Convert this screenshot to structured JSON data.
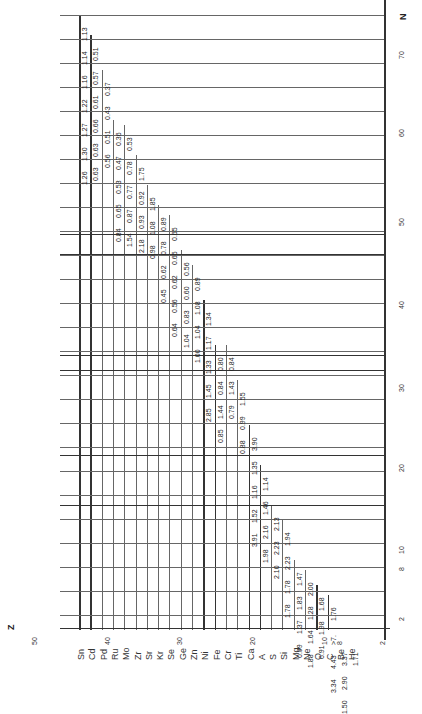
{
  "axes": {
    "z_label": "Z",
    "n_label": "N",
    "z_ticks": [
      "50",
      "40",
      "30",
      "20",
      "10",
      "8",
      "2"
    ],
    "n_ticks": [
      "70",
      "60",
      "50",
      "40",
      "30",
      "20",
      "10",
      "8",
      "2"
    ]
  },
  "elements": [
    "Sn",
    "Cd",
    "Pd",
    "Ru",
    "Mo",
    "Zr",
    "Sr",
    "Kr",
    "Se",
    "Ge",
    "Zn",
    "Ni",
    "Fe",
    "Cr",
    "Ti",
    "Ca",
    "A",
    "S",
    "Si",
    "Mg",
    "Ne",
    "O",
    "C",
    "Be",
    "He"
  ],
  "rows": [
    {
      "element": "Sn",
      "values": [
        "1.26",
        "1.30",
        "1.27",
        "1.22",
        "1.16",
        "1.14",
        "1.13"
      ]
    },
    {
      "element": "Cd",
      "values": [
        "0.63",
        "0.63",
        "0.66",
        "0.61",
        "0.57",
        "0.51"
      ]
    },
    {
      "element": "Pd",
      "values": [
        "0.56",
        "0.51",
        "0.43",
        "0.37"
      ]
    },
    {
      "element": "Ru",
      "values": [
        "0.84",
        "0.65",
        "0.53",
        "0.47",
        "0.36"
      ]
    },
    {
      "element": "Mo",
      "values": [
        "1.54",
        "0.87",
        "0.77",
        "0.78",
        "0.53"
      ]
    },
    {
      "element": "Zr",
      "values": [
        "2.18",
        "0.93",
        "0.92",
        "1.75"
      ]
    },
    {
      "element": "Sr",
      "values": [
        "0.98",
        "1.08",
        "1.85"
      ]
    },
    {
      "element": "Kr",
      "values": [
        "0.45",
        "0.62",
        "0.78",
        "0.89"
      ]
    },
    {
      "element": "Se",
      "values": [
        "0.64",
        "0.56",
        "0.62",
        "0.65",
        "0.65"
      ]
    },
    {
      "element": "Ge",
      "values": [
        "1.04",
        "0.83",
        "0.60",
        "0.56"
      ]
    },
    {
      "element": "Zn",
      "values": [
        "1.00",
        "1.04",
        "1.08",
        "0.89"
      ]
    },
    {
      "element": "Ni",
      "values": [
        "2.85",
        "1.45",
        "1.33",
        "1.17",
        "1.34"
      ]
    },
    {
      "element": "Fe",
      "values": [
        "0.85",
        "1.44",
        "0.84",
        "0.80"
      ]
    },
    {
      "element": "Cr",
      "values": [
        "0.79",
        "1.43",
        "0.84"
      ]
    },
    {
      "element": "Ti",
      "values": [
        "0.88",
        "0.99",
        "1.55"
      ]
    },
    {
      "element": "Ca",
      "values": [
        "3.91",
        "1.52",
        "1.16",
        "1.35",
        "3.90"
      ]
    },
    {
      "element": "A",
      "values": [
        "1.98",
        "2.16",
        "1.46",
        "1.14"
      ]
    },
    {
      "element": "S",
      "values": [
        "2.10",
        "2.23",
        "2.13"
      ]
    },
    {
      "element": "Si",
      "values": [
        "1.78",
        "1.78",
        "2.23",
        "1.94"
      ]
    },
    {
      "element": "Mg",
      "values": [
        "0.99",
        "1.37",
        "1.83",
        "1.47"
      ]
    },
    {
      "element": "Ne",
      "values": [
        "1.88",
        "1.64",
        "1.28",
        "2.00"
      ]
    },
    {
      "element": "O",
      "values": [
        "6.91",
        "1.98",
        "1.68"
      ]
    },
    {
      "element": "C",
      "values": [
        "3.34",
        "4.43",
        ">7.",
        "1.76"
      ]
    },
    {
      "element": "Be",
      "values": [
        "1.50",
        "2.90",
        "3.37"
      ]
    },
    {
      "element": "He",
      "values": [
        "1.71"
      ]
    }
  ]
}
